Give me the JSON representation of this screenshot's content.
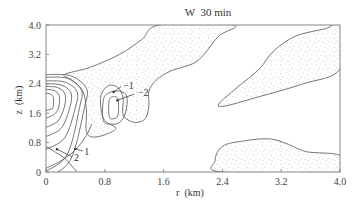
{
  "chart_data": {
    "type": "contour",
    "title": "W  30 min",
    "xlabel": "r  (km)",
    "ylabel": "z  (km)",
    "xlim": [
      0,
      4.0
    ],
    "ylim": [
      0,
      4.0
    ],
    "xticks": [
      "0",
      "0.8",
      "1.6",
      "2.4",
      "3.2",
      "4.0"
    ],
    "xtick_values": [
      0,
      0.8,
      1.6,
      2.4,
      3.2,
      4.0
    ],
    "yticks": [
      "0",
      "0.8",
      "1.6",
      "2.4",
      "3.2",
      "4.0"
    ],
    "ytick_values": [
      0,
      0.8,
      1.6,
      2.4,
      3.2,
      4.0
    ],
    "grid": false,
    "shading": "stippled regions denote negative W (downdraft)",
    "positive_contours_center": {
      "r": 0.0,
      "z": 1.9
    },
    "negative_regions": [
      {
        "name": "central-downdraft",
        "outline": [
          [
            0.25,
            2.65
          ],
          [
            0.6,
            2.85
          ],
          [
            1.0,
            3.2
          ],
          [
            1.3,
            3.6
          ],
          [
            1.55,
            4.0
          ],
          [
            2.55,
            4.0
          ],
          [
            2.35,
            3.7
          ],
          [
            2.15,
            3.2
          ],
          [
            2.0,
            2.95
          ],
          [
            1.7,
            2.75
          ],
          [
            1.5,
            2.5
          ],
          [
            1.4,
            2.2
          ],
          [
            1.4,
            1.8
          ],
          [
            1.35,
            1.45
          ],
          [
            1.2,
            1.35
          ],
          [
            1.05,
            1.55
          ],
          [
            1.05,
            2.0
          ],
          [
            0.98,
            2.3
          ],
          [
            0.85,
            2.35
          ],
          [
            0.75,
            2.1
          ],
          [
            0.75,
            1.7
          ],
          [
            0.8,
            1.4
          ],
          [
            0.95,
            1.2
          ],
          [
            0.85,
            1.05
          ],
          [
            0.65,
            0.95
          ],
          [
            0.55,
            1.1
          ],
          [
            0.55,
            1.7
          ],
          [
            0.5,
            2.2
          ],
          [
            0.35,
            2.5
          ]
        ]
      },
      {
        "name": "upper-right-downdraft",
        "outline": [
          [
            2.35,
            1.85
          ],
          [
            2.6,
            2.3
          ],
          [
            2.9,
            2.8
          ],
          [
            3.1,
            3.3
          ],
          [
            3.4,
            3.7
          ],
          [
            3.8,
            3.9
          ],
          [
            4.0,
            4.0
          ],
          [
            4.0,
            2.8
          ],
          [
            3.5,
            2.4
          ],
          [
            2.9,
            2.05
          ],
          [
            2.45,
            1.8
          ]
        ]
      },
      {
        "name": "lower-right-downdraft",
        "outline": [
          [
            2.4,
            0.0
          ],
          [
            2.3,
            0.3
          ],
          [
            2.4,
            0.7
          ],
          [
            2.7,
            0.85
          ],
          [
            3.05,
            0.9
          ],
          [
            3.3,
            0.75
          ],
          [
            3.55,
            0.55
          ],
          [
            4.0,
            0.45
          ],
          [
            4.0,
            0.0
          ]
        ]
      }
    ],
    "annotations": [
      {
        "text": "-1",
        "r": 1.05,
        "z": 2.35
      },
      {
        "text": "-2",
        "r": 1.25,
        "z": 2.15
      },
      {
        "text": "1",
        "r": 0.52,
        "z": 0.55
      },
      {
        "text": "2",
        "r": 0.38,
        "z": 0.38
      }
    ],
    "legend": "none"
  }
}
